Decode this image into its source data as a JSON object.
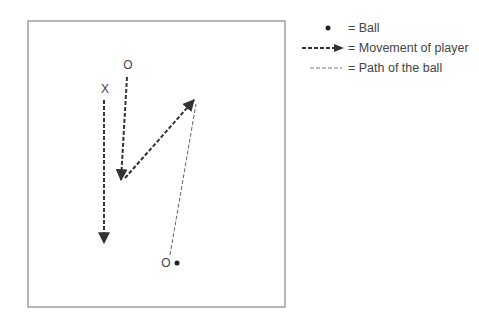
{
  "diagram": {
    "field": {
      "x": 28,
      "y": 21,
      "width": 257,
      "height": 286,
      "border_color": "#888888"
    },
    "players": [
      {
        "id": "defender-o-top",
        "symbol": "O",
        "x": 128,
        "y": 65
      },
      {
        "id": "attacker-x",
        "symbol": "X",
        "x": 105,
        "y": 89
      },
      {
        "id": "passer-o-bottom",
        "symbol": "O",
        "x": 166,
        "y": 263
      }
    ],
    "ball": {
      "x": 177,
      "y": 263
    },
    "player_movements": [
      {
        "from": [
          104,
          100
        ],
        "to": [
          104,
          243
        ],
        "label": "X runs down"
      },
      {
        "from": [
          127,
          77
        ],
        "to": [
          121,
          180
        ],
        "label": "O runs down"
      },
      {
        "from": [
          125,
          178
        ],
        "to": [
          194,
          100
        ],
        "label": "O cuts up-right"
      }
    ],
    "ball_paths": [
      {
        "from": [
          170,
          255
        ],
        "to": [
          196,
          104
        ]
      }
    ]
  },
  "legend": {
    "items": [
      {
        "symbol": "ball-dot",
        "label": "= Ball"
      },
      {
        "symbol": "dashed-arrow",
        "label": "= Movement of player"
      },
      {
        "symbol": "thin-dashed-line",
        "label": "= Path of the ball"
      }
    ]
  },
  "colors": {
    "ink": "#333333",
    "ball_path": "#666666",
    "border": "#888888"
  }
}
